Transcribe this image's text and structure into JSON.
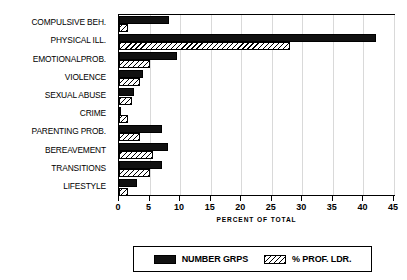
{
  "chart_data": {
    "type": "bar",
    "orientation": "horizontal",
    "title": "",
    "xlabel": "PERCENT OF TOTAL",
    "ylabel": "",
    "xlim": [
      0,
      45
    ],
    "xticks": [
      0,
      5,
      10,
      15,
      20,
      25,
      30,
      35,
      40,
      45
    ],
    "grid": true,
    "legend_position": "bottom",
    "categories": [
      "COMPULSIVE BEH.",
      "PHYSICAL ILL.",
      "EMOTIONALPROB.",
      "VIOLENCE",
      "SEXUAL ABUSE",
      "CRIME",
      "PARENTING PROB.",
      "BEREAVEMENT",
      "TRANSITIONS",
      "LIFESTYLE"
    ],
    "series": [
      {
        "name": "NUMBER GRPS",
        "style": "solid",
        "color": "#111111",
        "values": [
          8.2,
          42.0,
          9.5,
          4.0,
          2.5,
          0.4,
          7.0,
          8.0,
          7.0,
          3.0
        ]
      },
      {
        "name": "% PROF. LDR.",
        "style": "hatch",
        "color": "#000000",
        "values": [
          1.5,
          28.0,
          5.0,
          3.5,
          2.2,
          1.5,
          3.5,
          5.5,
          5.0,
          1.5
        ]
      }
    ]
  },
  "legend": {
    "items": [
      {
        "label": "NUMBER GRPS",
        "swatch": "solid-black-swatch"
      },
      {
        "label": "% PROF. LDR.",
        "swatch": "diagonal-hatch-swatch"
      }
    ]
  },
  "axis": {
    "x_title": "PERCENT OF TOTAL"
  }
}
